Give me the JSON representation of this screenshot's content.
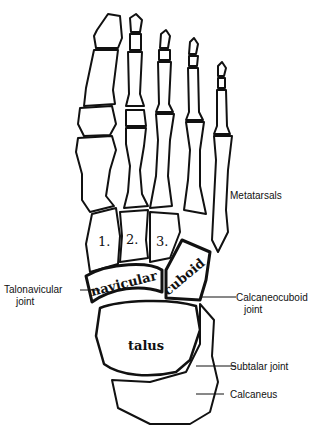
{
  "diagram": {
    "bones_in_drawing": {
      "cuneiforms": [
        "1.",
        "2.",
        "3."
      ],
      "navicular": "navicular",
      "cuboid": "cuboid",
      "talus": "talus"
    },
    "labels": {
      "metatarsals": "Metatarsals",
      "talonavicular_line1": "Talonavicular",
      "talonavicular_line2": "joint",
      "calcaneocuboid_line1": "Calcaneocuboid",
      "calcaneocuboid_line2": "joint",
      "subtalar": "Subtalar joint",
      "calcaneus": "Calcaneus"
    },
    "colors": {
      "ink": "#111111",
      "background": "#ffffff"
    }
  }
}
